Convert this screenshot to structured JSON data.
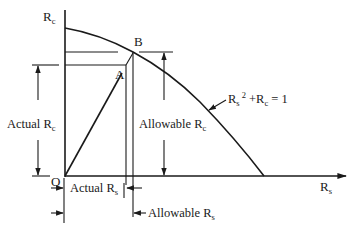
{
  "diagram": {
    "colors": {
      "line": "#1a1a1a",
      "background": "#ffffff"
    },
    "axes": {
      "y_axis": {
        "label_main": "R",
        "label_sub": "c"
      },
      "x_axis": {
        "label_main": "R",
        "label_sub": "s"
      },
      "origin": "O"
    },
    "points": {
      "A": "A",
      "B": "B"
    },
    "curve": {
      "equation_parts": {
        "r1": "R",
        "s1": "s",
        "pow": "2",
        "plus": " +",
        "r2": "R",
        "s2": "c",
        "eq": " = 1"
      }
    },
    "dimensions": {
      "actual_rc": {
        "main": "Actual R",
        "sub": "c"
      },
      "allowable_rc": {
        "main": "Allowable R",
        "sub": "c"
      },
      "actual_rs": {
        "main": "Actual R",
        "sub": "s"
      },
      "allowable_rs": {
        "main": "Allowable R",
        "sub": "s"
      }
    }
  }
}
